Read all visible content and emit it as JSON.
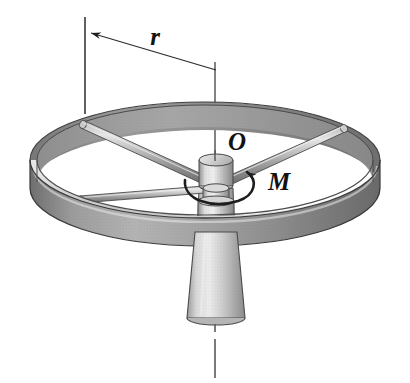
{
  "figure": {
    "kind": "engineering-mechanics-diagram",
    "background_color": "#ffffff",
    "width": 410,
    "height": 383
  },
  "labels": {
    "radius": "r",
    "center": "O",
    "moment": "M"
  },
  "annotations": {
    "radius_dimension": {
      "label": "r",
      "leader_from_x": 216,
      "leader_from_y": 68,
      "leader_to_x": 88,
      "leader_to_y": 33,
      "extension_line_x": 85,
      "extension_line_top_y": 18,
      "extension_line_bottom_y": 113,
      "arrow": "left-arrowhead"
    },
    "axis_centerline": {
      "style": "dash-dot",
      "top_y": 62,
      "bottom_y": 378,
      "x": 215
    },
    "moment_arrow": {
      "label": "M",
      "style": "curved-ccw-around-axis",
      "center_x": 216,
      "center_y": 180
    }
  },
  "colors": {
    "ink": "#121212",
    "ring_outer_face": "#8d8d8d",
    "ring_outer_face_dark": "#6d6d6d",
    "ring_top_face": "#cfcfcf",
    "ring_inner_face": "#9a9a9a",
    "ring_highlight": "#e8e8e8",
    "spoke_light": "#d8d8d8",
    "spoke_mid": "#9c9c9c",
    "spoke_dark": "#6a6a6a",
    "hub_light": "#e2e2e2",
    "hub_mid": "#b0b0b0",
    "hub_dark": "#777777",
    "cone_light": "#e4e4e4",
    "cone_mid": "#bdbdbd",
    "cone_dark": "#8a8a8a",
    "outline": "#3a3a3a",
    "leader_line": "#2b2b2b"
  },
  "geometry": {
    "ring": {
      "center_x": 205,
      "center_y": 160,
      "radius_x": 175,
      "radius_y": 58,
      "band_height": 28,
      "rim_thickness": 7
    },
    "spokes": [
      {
        "name": "spoke-upper-left",
        "end_x": 83,
        "end_y": 125
      },
      {
        "name": "spoke-lower-left",
        "end_x": 78,
        "end_y": 200
      },
      {
        "name": "spoke-right",
        "end_x": 345,
        "end_y": 128
      }
    ],
    "hub": {
      "top_cap_x": 216,
      "top_cap_y": 158,
      "top_cap_rx": 17,
      "top_cap_ry": 6,
      "body_height": 26
    },
    "cone": {
      "top_x": 216,
      "top_y": 232,
      "top_half_width": 21,
      "bottom_y": 320,
      "bottom_half_width": 29
    }
  }
}
